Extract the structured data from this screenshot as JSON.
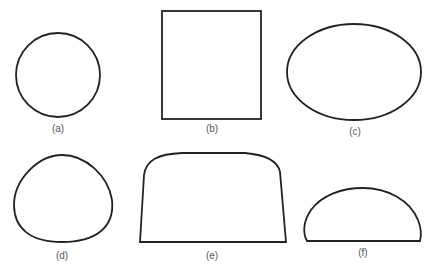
{
  "figure": {
    "panels": [
      {
        "id": "a",
        "label": "(a)",
        "shape": "circle"
      },
      {
        "id": "b",
        "label": "(b)",
        "shape": "square"
      },
      {
        "id": "c",
        "label": "(c)",
        "shape": "ellipse"
      },
      {
        "id": "d",
        "label": "(d)",
        "shape": "rounded-triangle"
      },
      {
        "id": "e",
        "label": "(e)",
        "shape": "flat-bottom-rounded-top-trapezoid"
      },
      {
        "id": "f",
        "label": "(f)",
        "shape": "half-ellipse"
      }
    ],
    "colors": {
      "stroke": "#222222",
      "label": "#555555",
      "background": "#ffffff"
    }
  }
}
